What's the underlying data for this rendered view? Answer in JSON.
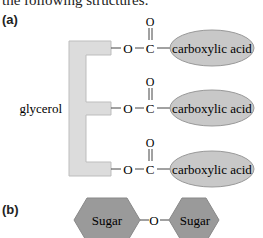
{
  "intro_text": "the following structures:",
  "part_a": {
    "label": "(a)",
    "backbone_label": "glycerol",
    "arms": [
      {
        "o": "O",
        "c": "C",
        "carbonyl_o": "O",
        "group": "carboxylic acid"
      },
      {
        "o": "O",
        "c": "C",
        "carbonyl_o": "O",
        "group": "carboxylic acid"
      },
      {
        "o": "O",
        "c": "C",
        "carbonyl_o": "O",
        "group": "carboxylic acid"
      }
    ]
  },
  "part_b": {
    "label": "(b)",
    "left": "Sugar",
    "linker": "O",
    "right": "Sugar"
  },
  "colors": {
    "backbone_fill": "#dcdcdc",
    "ellipse_fill": "#c8c8c8",
    "hexagon_fill": "#9a9a9a",
    "line": "#444444"
  }
}
